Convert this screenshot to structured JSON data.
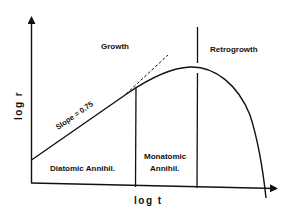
{
  "diagram": {
    "type": "log-log growth curve",
    "axes": {
      "x_label": "log t",
      "y_label": "log r"
    },
    "regions": {
      "growth": "Growth",
      "retrogrowth": "Retrogrowth",
      "diatomic": "Diatomic Annihil.",
      "monatomic_line1": "Monatomic",
      "monatomic_line2": "Annihil."
    },
    "annotations": {
      "slope": "Slope = 0.75"
    },
    "colors": {
      "line": "#111111",
      "background": "#ffffff"
    }
  }
}
